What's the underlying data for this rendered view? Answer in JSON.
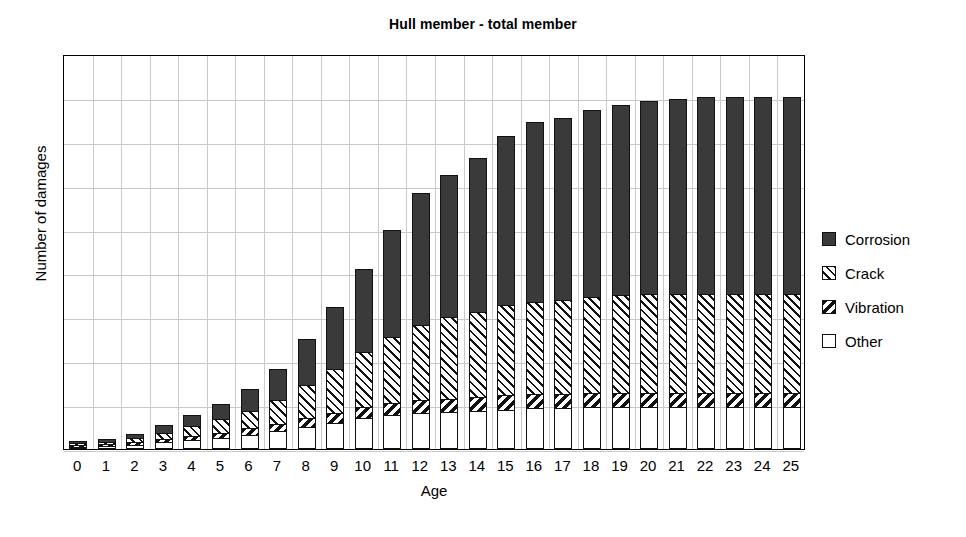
{
  "chart_data": {
    "type": "bar",
    "title": "Hull member - total member",
    "xlabel": "Age",
    "ylabel": "Number of damages",
    "grid": true,
    "legend_position": "right",
    "stacked": true,
    "ylim": [
      0,
      100
    ],
    "yticks": [
      0,
      10,
      20,
      30,
      40,
      50,
      60,
      70,
      80,
      90,
      100
    ],
    "ytick_labels": [
      "",
      "",
      "",
      "",
      "",
      "",
      "",
      "",
      "",
      "",
      ""
    ],
    "categories": [
      "0",
      "1",
      "2",
      "3",
      "4",
      "5",
      "6",
      "7",
      "8",
      "9",
      "10",
      "11",
      "12",
      "13",
      "14",
      "15",
      "16",
      "17",
      "18",
      "19",
      "20",
      "21",
      "22",
      "23",
      "24",
      "25"
    ],
    "series": [
      {
        "name": "Other",
        "color": "#ffffff",
        "pattern": "solid-white",
        "values": [
          1,
          1.5,
          2,
          3,
          4,
          5,
          6.5,
          8,
          10,
          12,
          14,
          15.5,
          16.5,
          17,
          17.5,
          18,
          18.5,
          18.5,
          19,
          19,
          19,
          19,
          19,
          19,
          19,
          19
        ]
      },
      {
        "name": "Vibration",
        "color": "#111111",
        "pattern": "dark-back-diagonal",
        "values": [
          0.5,
          0.7,
          1,
          1.5,
          2,
          2.5,
          3,
          3.5,
          4,
          4.5,
          5,
          5.5,
          6,
          6,
          6,
          6.5,
          6.5,
          6.5,
          6.5,
          6.5,
          6.5,
          6.5,
          6.5,
          6.5,
          6.5,
          6.5
        ]
      },
      {
        "name": "Crack",
        "color": "#ffffff",
        "pattern": "light-forward-hatch",
        "values": [
          0.5,
          1,
          2,
          3,
          4.5,
          6,
          8,
          11,
          15,
          20,
          25,
          30,
          34,
          37,
          39,
          41,
          42,
          43,
          44,
          44.5,
          45,
          45,
          45,
          45,
          45,
          45
        ]
      },
      {
        "name": "Corrosion",
        "color": "#3a3a3a",
        "pattern": "solid-dark",
        "values": [
          0.5,
          1,
          2,
          3.5,
          5,
          7,
          10,
          14,
          21,
          28,
          38,
          49,
          60,
          65,
          70,
          77,
          82,
          83,
          85,
          87,
          88,
          89,
          90,
          90,
          90,
          90
        ]
      }
    ],
    "totals": [
      2.5,
      4.2,
      7,
      11,
      15.5,
      20.5,
      27.5,
      36.5,
      50,
      64.5,
      82,
      100,
      116.5,
      125,
      132.5,
      142.5,
      149,
      151,
      154.5,
      157,
      158.5,
      159.5,
      160.5,
      160.5,
      160.5,
      160.5
    ]
  },
  "legend": {
    "items": [
      {
        "label": "Corrosion",
        "swatch": "corrosion-swatch"
      },
      {
        "label": "Crack",
        "swatch": "crack-swatch"
      },
      {
        "label": "Vibration",
        "swatch": "vibration-swatch"
      },
      {
        "label": "Other",
        "swatch": "other-swatch"
      }
    ]
  }
}
